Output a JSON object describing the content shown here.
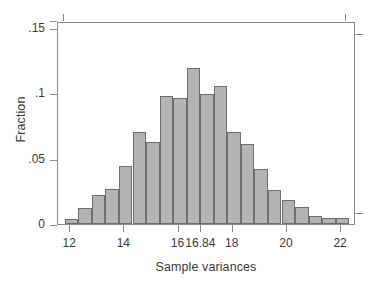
{
  "chart_data": {
    "type": "bar",
    "title": "",
    "subtitle": "",
    "xlabel": "Sample variances",
    "ylabel": "Fraction",
    "xlim": [
      11.55,
      22.55
    ],
    "ylim": [
      0,
      0.155
    ],
    "grid": false,
    "legend": null,
    "bin_width": 0.5,
    "bar_fill_color": "#b3b3b3",
    "bar_edge_color": "#6e6e6e",
    "frame_color": "#8a8a8a",
    "text_color": "#3a3a3a",
    "xticks": [
      {
        "value": 12,
        "label": "12"
      },
      {
        "value": 14,
        "label": "14"
      },
      {
        "value": 16,
        "label": "16"
      },
      {
        "value": 16.84,
        "label": "16.84"
      },
      {
        "value": 18,
        "label": "18"
      },
      {
        "value": 20,
        "label": "20"
      },
      {
        "value": 22,
        "label": "22"
      }
    ],
    "yticks": [
      {
        "value": 0,
        "label": "0"
      },
      {
        "value": 0.05,
        "label": ".05"
      },
      {
        "value": 0.1,
        "label": ".1"
      },
      {
        "value": 0.15,
        "label": ".15"
      }
    ],
    "bins": [
      {
        "left": 11.8,
        "right": 12.3,
        "center": 12.05,
        "value": 0.004
      },
      {
        "left": 12.3,
        "right": 12.8,
        "center": 12.55,
        "value": 0.012
      },
      {
        "left": 12.8,
        "right": 13.3,
        "center": 13.05,
        "value": 0.022
      },
      {
        "left": 13.3,
        "right": 13.8,
        "center": 13.55,
        "value": 0.027
      },
      {
        "left": 13.8,
        "right": 14.3,
        "center": 14.05,
        "value": 0.044
      },
      {
        "left": 14.3,
        "right": 14.8,
        "center": 14.55,
        "value": 0.07
      },
      {
        "left": 14.8,
        "right": 15.3,
        "center": 15.05,
        "value": 0.063
      },
      {
        "left": 15.3,
        "right": 15.8,
        "center": 15.55,
        "value": 0.098
      },
      {
        "left": 15.8,
        "right": 16.3,
        "center": 16.05,
        "value": 0.096
      },
      {
        "left": 16.3,
        "right": 16.8,
        "center": 16.55,
        "value": 0.119
      },
      {
        "left": 16.8,
        "right": 17.3,
        "center": 17.05,
        "value": 0.099
      },
      {
        "left": 17.3,
        "right": 17.8,
        "center": 17.55,
        "value": 0.105
      },
      {
        "left": 17.8,
        "right": 18.3,
        "center": 18.05,
        "value": 0.07
      },
      {
        "left": 18.3,
        "right": 18.8,
        "center": 18.55,
        "value": 0.061
      },
      {
        "left": 18.8,
        "right": 19.3,
        "center": 19.05,
        "value": 0.042
      },
      {
        "left": 19.3,
        "right": 19.8,
        "center": 19.55,
        "value": 0.026
      },
      {
        "left": 19.8,
        "right": 20.3,
        "center": 20.05,
        "value": 0.018
      },
      {
        "left": 20.3,
        "right": 20.8,
        "center": 20.55,
        "value": 0.013
      },
      {
        "left": 20.8,
        "right": 21.3,
        "center": 21.05,
        "value": 0.0065
      },
      {
        "left": 21.3,
        "right": 21.8,
        "center": 21.55,
        "value": 0.0045
      },
      {
        "left": 21.8,
        "right": 22.3,
        "center": 22.05,
        "value": 0.0045
      }
    ],
    "categories": [
      "12.05",
      "12.55",
      "13.05",
      "13.55",
      "14.05",
      "14.55",
      "15.05",
      "15.55",
      "16.05",
      "16.55",
      "17.05",
      "17.55",
      "18.05",
      "18.55",
      "19.05",
      "19.55",
      "20.05",
      "20.55",
      "21.05",
      "21.55",
      "22.05"
    ],
    "values": [
      0.004,
      0.012,
      0.022,
      0.027,
      0.044,
      0.07,
      0.063,
      0.098,
      0.096,
      0.119,
      0.099,
      0.105,
      0.07,
      0.061,
      0.042,
      0.026,
      0.018,
      0.013,
      0.0065,
      0.0045,
      0.0045
    ]
  }
}
